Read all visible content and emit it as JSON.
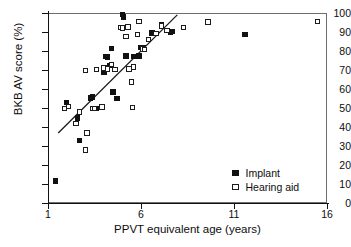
{
  "chart_data": {
    "type": "scatter",
    "title": "",
    "xlabel": "PPVT equivalent age (years)",
    "ylabel": "BKB AV score (%)",
    "xlim": [
      1,
      16
    ],
    "ylim": [
      0,
      100
    ],
    "xticks": [
      1,
      6,
      11,
      16
    ],
    "yticks": [
      0,
      10,
      20,
      30,
      40,
      50,
      60,
      70,
      80,
      90,
      100
    ],
    "grid": false,
    "legend_position": "bottom-right",
    "series": [
      {
        "name": "Implant",
        "marker": "filled-square",
        "color": "#111111",
        "points": [
          [
            1.4,
            11.6
          ],
          [
            2.0,
            53.0
          ],
          [
            2.6,
            44.7
          ],
          [
            2.7,
            32.8
          ],
          [
            3.3,
            55.3
          ],
          [
            3.4,
            55.8
          ],
          [
            3.6,
            49.6
          ],
          [
            4.0,
            68.8
          ],
          [
            4.1,
            77.2
          ],
          [
            4.2,
            76.8
          ],
          [
            4.3,
            72.5
          ],
          [
            4.4,
            81.2
          ],
          [
            4.5,
            58.4
          ],
          [
            4.7,
            55.0
          ],
          [
            5.0,
            99.3
          ],
          [
            5.05,
            97.8
          ],
          [
            5.2,
            77.4
          ],
          [
            5.6,
            77.2
          ],
          [
            5.9,
            77.4
          ],
          [
            6.0,
            81.8
          ],
          [
            6.15,
            82.0
          ],
          [
            6.4,
            86.1
          ],
          [
            6.6,
            89.4
          ],
          [
            7.1,
            94.0
          ],
          [
            7.6,
            89.8
          ],
          [
            7.7,
            90.3
          ],
          [
            11.6,
            88.6
          ]
        ]
      },
      {
        "name": "Hearing aid",
        "marker": "open-square",
        "color": "#1c1c1c",
        "points": [
          [
            1.9,
            49.6
          ],
          [
            2.1,
            50.7
          ],
          [
            2.5,
            41.8
          ],
          [
            2.7,
            47.8
          ],
          [
            3.0,
            27.9
          ],
          [
            3.0,
            69.6
          ],
          [
            3.1,
            36.9
          ],
          [
            3.4,
            49.7
          ],
          [
            3.5,
            49.8
          ],
          [
            3.6,
            70.3
          ],
          [
            3.9,
            50.5
          ],
          [
            4.0,
            71.0
          ],
          [
            4.2,
            70.6
          ],
          [
            4.4,
            73.0
          ],
          [
            4.6,
            70.4
          ],
          [
            4.9,
            92.5
          ],
          [
            5.0,
            92.2
          ],
          [
            5.2,
            87.5
          ],
          [
            5.3,
            92.7
          ],
          [
            5.35,
            70.6
          ],
          [
            5.5,
            63.7
          ],
          [
            5.55,
            50.4
          ],
          [
            5.6,
            71.5
          ],
          [
            5.8,
            88.7
          ],
          [
            5.9,
            95.5
          ],
          [
            6.1,
            81.0
          ],
          [
            6.2,
            80.8
          ],
          [
            6.4,
            85.9
          ],
          [
            6.8,
            89.3
          ],
          [
            7.1,
            93.2
          ],
          [
            7.4,
            90.7
          ],
          [
            8.3,
            92.3
          ],
          [
            9.6,
            95.2
          ],
          [
            15.5,
            95.6
          ]
        ]
      }
    ],
    "regression_line": {
      "x_start": 1.55,
      "y_start": 36.8,
      "x_end": 7.95,
      "y_end": 99.0
    }
  },
  "legend": {
    "items": [
      {
        "label": "Implant",
        "marker": "filled-square"
      },
      {
        "label": "Hearing aid",
        "marker": "open-square"
      }
    ]
  }
}
